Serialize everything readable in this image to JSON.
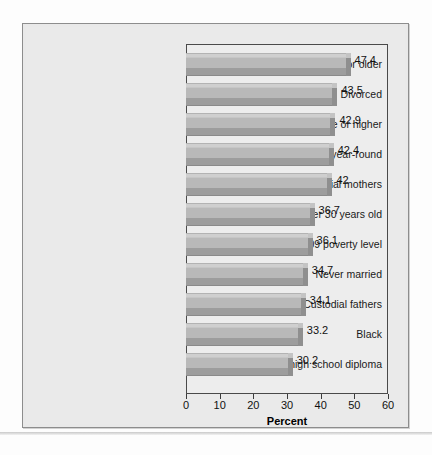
{
  "chart_data": {
    "type": "bar",
    "orientation": "horizontal",
    "title": "",
    "xlabel": "Percent",
    "ylabel": "",
    "xlim": [
      0,
      60
    ],
    "xticks": [
      "0",
      "10",
      "20",
      "30",
      "40",
      "50",
      "60"
    ],
    "grid": false,
    "legend": null,
    "categories": [
      "40 years or older",
      "Divorced",
      "Bachelor's degree or higher",
      "Worked full-time, year-round",
      "Custodial mothers",
      "Under 30 years old",
      "Below 2009 poverty level",
      "Never married",
      "Custodial fathers",
      "Black",
      "Less than high school diploma"
    ],
    "values": [
      47.4,
      43.5,
      42.9,
      42.4,
      42,
      36.7,
      36.1,
      34.7,
      34.1,
      33.2,
      30.2
    ],
    "value_labels": [
      "47.4",
      "43.5",
      "42.9",
      "42.4",
      "42",
      "36.7",
      "36.1",
      "34.7",
      "34.1",
      "33.2",
      "30.2"
    ],
    "bar_color": "#b9b9b9",
    "bar_top_color": "#cfcfcf",
    "bar_shadow_color": "#9d9d9d"
  }
}
